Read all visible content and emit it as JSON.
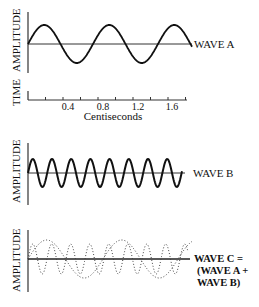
{
  "panels": {
    "wave_a": {
      "ylabel": "AMPLITUDE",
      "label": "WAVE A"
    },
    "time_axis": {
      "label": "TIME",
      "unit": "Centiseconds",
      "ticks": [
        "0.4",
        "0.8",
        "1.2",
        "1.6"
      ]
    },
    "wave_b": {
      "ylabel": "AMPLITUDE",
      "label": "WAVE B"
    },
    "wave_c": {
      "ylabel": "AMPLITUDE",
      "label_lines": [
        "WAVE C =",
        "(WAVE A +",
        "WAVE B)"
      ]
    }
  },
  "colors": {
    "line": "#111111",
    "axis": "#333333"
  }
}
